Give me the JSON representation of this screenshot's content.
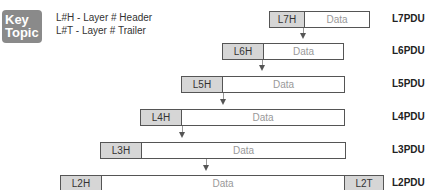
{
  "key_topic": {
    "line1": "Key",
    "line2": "Topic"
  },
  "legend": {
    "header": "L#H - Layer # Header",
    "trailer": "L#T - Layer # Trailer"
  },
  "pdus": [
    {
      "header": "L7H",
      "data": "Data",
      "label": "L7PDU"
    },
    {
      "header": "L6H",
      "data": "Data",
      "label": "L6PDU"
    },
    {
      "header": "L5H",
      "data": "Data",
      "label": "L5PDU"
    },
    {
      "header": "L4H",
      "data": "Data",
      "label": "L4PDU"
    },
    {
      "header": "L3H",
      "data": "Data",
      "label": "L3PDU"
    },
    {
      "header": "L2H",
      "data": "Data",
      "trailer": "L2T",
      "label": "L2PDU"
    }
  ]
}
